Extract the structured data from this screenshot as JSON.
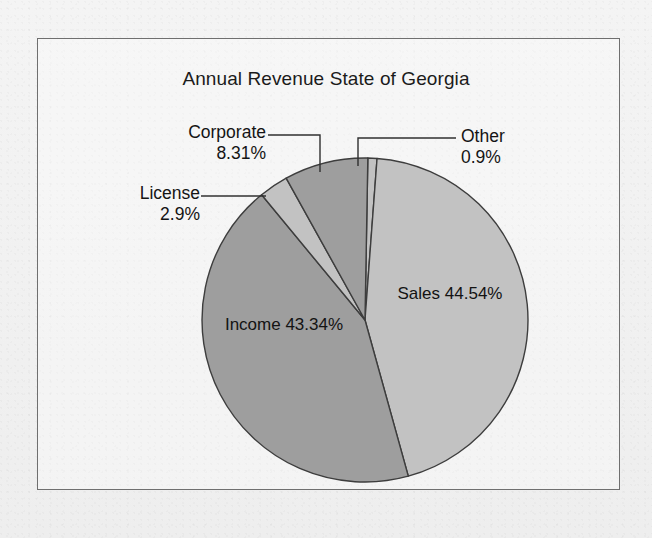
{
  "figure": {
    "title": "Annual Revenue State of Georgia",
    "frame": {
      "border_color": "#6f6f6f"
    },
    "background_color": "#f1f1f1"
  },
  "chart_data": {
    "type": "pie",
    "title": "Annual Revenue State of Georgia",
    "xlabel": "",
    "ylabel": "",
    "grid": false,
    "legend": "none",
    "label_style": "inside-and-callout",
    "start_angle_deg": 0,
    "direction": "clockwise",
    "categories": [
      "Other",
      "Sales",
      "Income",
      "License",
      "Corporate"
    ],
    "values": [
      0.9,
      44.54,
      43.34,
      2.9,
      8.31
    ],
    "value_unit": "percent",
    "slices": [
      {
        "name": "Other",
        "label": "Other",
        "value_label": "0.9%",
        "value": 0.9,
        "fill": "#c2c2c2",
        "label_placement": "callout-right",
        "label_id": "cal-other"
      },
      {
        "name": "Sales",
        "label": "Sales",
        "value_label": "44.54%",
        "value": 44.54,
        "fill": "#c2c2c2",
        "label_placement": "inside",
        "label_id": "lbl-sales"
      },
      {
        "name": "Income",
        "label": "Income",
        "value_label": "43.34%",
        "value": 43.34,
        "fill": "#9e9e9e",
        "label_placement": "inside",
        "label_id": "lbl-income"
      },
      {
        "name": "License",
        "label": "License",
        "value_label": "2.9%",
        "value": 2.9,
        "fill": "#c2c2c2",
        "label_placement": "callout-left",
        "label_id": "cal-license"
      },
      {
        "name": "Corporate",
        "label": "Corporate",
        "value_label": "8.31%",
        "value": 8.31,
        "fill": "#9e9e9e",
        "label_placement": "callout-left",
        "label_id": "cal-corporate"
      }
    ],
    "colors": {
      "light_slice": "#c2c2c2",
      "dark_slice": "#9e9e9e",
      "slice_outline": "#3d3d3d",
      "leader_line": "#303030",
      "text": "#141414"
    },
    "geometry": {
      "center_x": 365,
      "center_y": 320,
      "radius_x": 163,
      "radius_y": 162
    }
  }
}
